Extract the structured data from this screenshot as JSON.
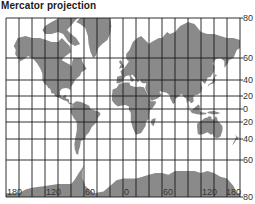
{
  "title": "Mercator projection",
  "colors": {
    "land": "#8a8a8a",
    "grid": "#1a1a1a",
    "background": "#ffffff",
    "text": "#333333"
  },
  "graticule": {
    "longitudes": [
      -180,
      -160,
      -140,
      -120,
      -100,
      -80,
      -60,
      -40,
      -20,
      0,
      20,
      40,
      60,
      80,
      100,
      120,
      140,
      160,
      180
    ],
    "latitudes": [
      80,
      60,
      40,
      20,
      0,
      -20,
      -40,
      -60,
      -80
    ]
  },
  "latitude_labels": [
    "80",
    "60",
    "40",
    "20",
    "0",
    "20",
    "40",
    "60",
    "80"
  ],
  "longitude_labels": [
    {
      "lon": -180,
      "text": "180"
    },
    {
      "lon": -120,
      "text": "120"
    },
    {
      "lon": -60,
      "text": "60"
    },
    {
      "lon": 0,
      "text": "0"
    },
    {
      "lon": 60,
      "text": "60"
    },
    {
      "lon": 120,
      "text": "120"
    },
    {
      "lon": 180,
      "text": "180"
    }
  ],
  "landmasses": [
    {
      "name": "north-america"
    },
    {
      "name": "greenland"
    },
    {
      "name": "canadian-arctic-islands"
    },
    {
      "name": "south-america"
    },
    {
      "name": "europe-asia"
    },
    {
      "name": "africa"
    },
    {
      "name": "madagascar"
    },
    {
      "name": "arabia"
    },
    {
      "name": "india"
    },
    {
      "name": "southeast-asia-islands"
    },
    {
      "name": "japan"
    },
    {
      "name": "australia"
    },
    {
      "name": "new-zealand"
    },
    {
      "name": "british-isles"
    },
    {
      "name": "antarctica"
    }
  ]
}
